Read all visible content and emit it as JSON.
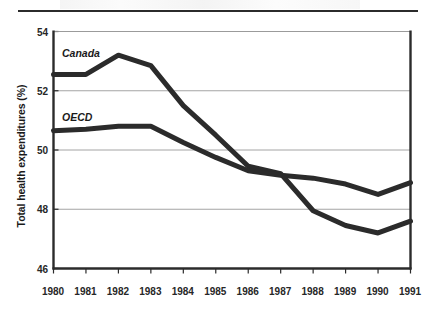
{
  "figure": {
    "top_rule": "horizontal-rule",
    "ylabel": "Total health expenditures (%)"
  },
  "chart_data": {
    "type": "line",
    "title": "",
    "subtitle": "",
    "xlabel": "",
    "ylabel": "Total health expenditures (%)",
    "categories": [
      "1980",
      "1981",
      "1982",
      "1983",
      "1984",
      "1985",
      "1986",
      "1987",
      "1988",
      "1989",
      "1990",
      "1991"
    ],
    "x": [
      1980,
      1981,
      1982,
      1983,
      1984,
      1985,
      1986,
      1987,
      1988,
      1989,
      1990,
      1991
    ],
    "xlim": [
      1980,
      1991
    ],
    "ylim": [
      46,
      54
    ],
    "yticks": [
      46,
      48,
      50,
      52,
      54
    ],
    "ytick_labels": [
      "46",
      "48",
      "50",
      "52",
      "54"
    ],
    "grid": "horizontal",
    "legend_position": "inline-labels",
    "line_color": "#2b2b2b",
    "line_width_px": 5,
    "series": [
      {
        "name": "Canada",
        "label_position": "upper-left",
        "values": [
          52.55,
          52.55,
          53.2,
          52.85,
          51.5,
          50.5,
          49.45,
          49.2,
          47.95,
          47.45,
          47.2,
          47.6
        ]
      },
      {
        "name": "OECD",
        "label_position": "middle-left",
        "values": [
          50.65,
          50.7,
          50.8,
          50.8,
          50.25,
          49.75,
          49.3,
          49.15,
          49.05,
          48.85,
          48.5,
          48.9
        ]
      }
    ],
    "annotations": [
      {
        "text": "Canada",
        "series": "Canada"
      },
      {
        "text": "OECD",
        "series": "OECD"
      }
    ]
  },
  "colors": {
    "line": "#2b2b2b",
    "grid": "#9a9a9a",
    "frame": "#2b2b2b",
    "text": "#1a1a1a",
    "background": "#ffffff"
  }
}
